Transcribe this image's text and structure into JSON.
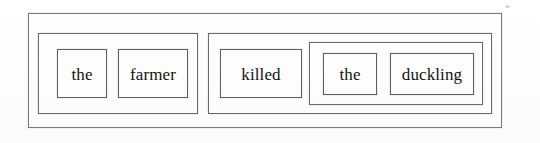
{
  "figure": {
    "type": "constituency-box-diagram",
    "notation": "Chinese box diagram",
    "sentence": "the farmer killed the duckling",
    "background_color": "#fdfdfc",
    "line_color": "#6d6d6d",
    "text_color": "#131313"
  },
  "sentence_box": {
    "label": "S",
    "x": 28,
    "y": 13,
    "width": 474,
    "height": 115
  },
  "constituents": [
    {
      "id": "np-subject",
      "label": "NP",
      "x": 38,
      "y": 33,
      "width": 160,
      "height": 81,
      "words": [
        {
          "id": "det-the-1",
          "text": "the",
          "x": 18,
          "y": 15,
          "width": 50,
          "height": 49
        },
        {
          "id": "noun-farmer",
          "text": "farmer",
          "x": 79,
          "y": 15,
          "width": 70,
          "height": 49
        }
      ],
      "nested": []
    },
    {
      "id": "vp-predicate",
      "label": "VP",
      "x": 208,
      "y": 33,
      "width": 284,
      "height": 81,
      "words": [
        {
          "id": "verb-killed",
          "text": "killed",
          "x": 11,
          "y": 15,
          "width": 82,
          "height": 49
        }
      ],
      "nested": [
        {
          "id": "np-object",
          "label": "NP",
          "x": 100,
          "y": 8,
          "width": 174,
          "height": 63,
          "words": [
            {
              "id": "det-the-2",
              "text": "the",
              "x": 13,
              "y": 10,
              "width": 54,
              "height": 42
            },
            {
              "id": "noun-duckling",
              "text": "duckling",
              "x": 80,
              "y": 10,
              "width": 84,
              "height": 42
            }
          ]
        }
      ]
    }
  ],
  "words_in_order": [
    "the",
    "farmer",
    "killed",
    "the",
    "duckling"
  ]
}
